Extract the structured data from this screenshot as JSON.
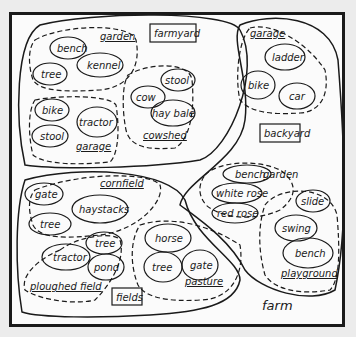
{
  "diagram": {
    "root": {
      "label": "farm"
    },
    "regions": [
      {
        "label": "farmyard",
        "subsets": [
          {
            "label": "garden",
            "items": [
              "bench",
              "kennel",
              "tree"
            ]
          },
          {
            "label": "garage",
            "items": [
              "bike",
              "tractor",
              "stool"
            ]
          },
          {
            "label": "cowshed",
            "items": [
              "stool",
              "cow",
              "hay bale"
            ]
          }
        ]
      },
      {
        "label": "backyard",
        "subsets": [
          {
            "label": "garage",
            "items": [
              "ladder",
              "bike",
              "car"
            ]
          },
          {
            "label": "garden",
            "items": [
              "bench",
              "white rose",
              "red rose"
            ]
          },
          {
            "label": "playground",
            "items": [
              "slide",
              "swing",
              "bench"
            ]
          }
        ]
      },
      {
        "label": "fields",
        "subsets": [
          {
            "label": "cornfield",
            "items": [
              "gate",
              "haystacks",
              "tree"
            ]
          },
          {
            "label": "ploughed field",
            "items": [
              "tree",
              "tractor",
              "pond"
            ]
          },
          {
            "label": "pasture",
            "items": [
              "horse",
              "tree",
              "gate"
            ]
          }
        ]
      }
    ]
  }
}
